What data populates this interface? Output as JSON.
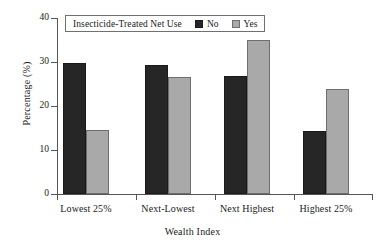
{
  "chart_data": {
    "type": "bar",
    "title": "",
    "xlabel": "Wealth Index",
    "ylabel": "Percentage (%)",
    "categories": [
      "Lowest 25%",
      "Next-Lowest",
      "Next Highest",
      "Highest 25%"
    ],
    "series": [
      {
        "name": "No",
        "color": "#262626",
        "values": [
          29.7,
          29.4,
          26.9,
          14.3
        ]
      },
      {
        "name": "Yes",
        "color": "#a9a9a9",
        "values": [
          14.5,
          26.7,
          35.0,
          23.8
        ]
      }
    ],
    "legend": {
      "title": "Insecticide-Treated Net Use",
      "position": "top-left-inside",
      "entries": [
        "No",
        "Yes"
      ]
    },
    "ylim": [
      0,
      40
    ],
    "yticks": [
      0,
      10,
      20,
      30,
      40
    ],
    "ytick_labels": [
      "0",
      "10",
      "20",
      "30",
      "40"
    ],
    "grid": false
  },
  "axes": {
    "y_label": "Percentage (%)",
    "x_label": "Wealth Index",
    "y_tick_labels": [
      "40",
      "30",
      "20",
      "10",
      "0"
    ]
  },
  "legend": {
    "title": "Insecticide-Treated Net Use",
    "no_label": "No",
    "yes_label": "Yes"
  },
  "categories": {
    "c0": "Lowest 25%",
    "c1": "Next-Lowest",
    "c2": "Next Highest",
    "c3": "Highest 25%"
  },
  "colors": {
    "no": "#262626",
    "yes": "#a9a9a9",
    "axis": "#555555",
    "text": "#1a1a1a",
    "background": "#ffffff"
  }
}
